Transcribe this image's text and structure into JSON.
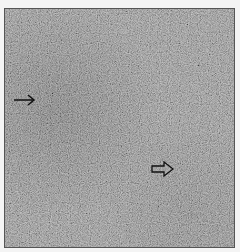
{
  "image": {
    "description": "Grayscale light micrograph of densely packed cells with two arrows",
    "colors": {
      "background": "#f4f4f4",
      "tissue_base": "#8a8a8a",
      "dark_region": "#5a5a5a",
      "arrow": "#111111"
    },
    "annotations": [
      {
        "type": "solid-arrow",
        "direction": "right",
        "position": "left-middle"
      },
      {
        "type": "open-arrow",
        "direction": "right",
        "position": "lower-right"
      }
    ]
  }
}
